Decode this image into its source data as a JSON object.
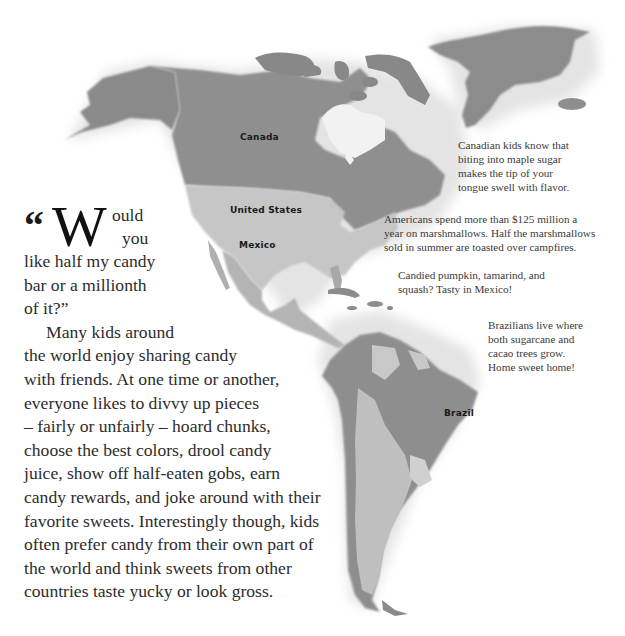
{
  "map": {
    "colors": {
      "canada": "#8e8e8e",
      "united_states": "#c4c4c4",
      "mexico": "#b0b0b0",
      "greenland": "#8a8a8a",
      "south_america_dark": "#8c8c8c",
      "south_america_light": "#bdbdbd",
      "coast_shadow": "#d8d8d8"
    },
    "labels": {
      "canada": "Canada",
      "united_states": "United States",
      "mexico": "Mexico",
      "brazil": "Brazil"
    }
  },
  "notes": {
    "canada": [
      "Canadian kids know that",
      "biting into maple sugar",
      "makes the tip of your",
      "tongue swell with flavor."
    ],
    "usa": [
      "Americans spend more than $125 million a",
      "year on marshmallows. Half the marshmallows",
      "sold in summer are toasted over campfires."
    ],
    "mexico": [
      "Candied pumpkin, tamarind, and",
      "squash? Tasty in Mexico!"
    ],
    "brazil": [
      "Brazilians live where",
      "both sugarcane and",
      "cacao trees grow.",
      "Home sweet home!"
    ]
  },
  "main_text": {
    "quote_mark": "“",
    "drop_cap": "W",
    "first_rest": "ould",
    "second_rest": "you",
    "lines": [
      "like half my candy",
      "bar or a millionth",
      "of it?”"
    ],
    "paragraph_lines": [
      "Many kids around",
      "the world enjoy sharing candy",
      "with friends. At one time or another,",
      "everyone likes to divvy up pieces",
      "– fairly or unfairly – hoard chunks,",
      "choose the best colors, drool candy",
      "juice, show off half-eaten gobs, earn",
      "candy rewards, and joke around with their",
      "favorite sweets. Interestingly though, kids",
      "often prefer candy from their own part of",
      "the world and think sweets from other",
      "countries taste yucky or look gross."
    ]
  }
}
